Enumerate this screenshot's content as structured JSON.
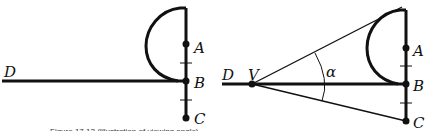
{
  "figure": {
    "caption_partial": "Figure 17.13 (Illustration of viewing angle)",
    "left_panel": {
      "points": [
        {
          "label": "A",
          "x": 186,
          "y": 44
        },
        {
          "label": "B",
          "x": 186,
          "y": 81
        },
        {
          "label": "C",
          "x": 186,
          "y": 118
        }
      ],
      "line_label": "D"
    },
    "right_panel": {
      "points": [
        {
          "label": "A",
          "x": 406,
          "y": 48
        },
        {
          "label": "B",
          "x": 406,
          "y": 84
        },
        {
          "label": "C",
          "x": 406,
          "y": 121
        },
        {
          "label": "V",
          "x": 252,
          "y": 84
        }
      ],
      "line_label": "D",
      "angle_label": "α"
    },
    "colors": {
      "ink": "#111111",
      "background": "#ffffff"
    }
  }
}
